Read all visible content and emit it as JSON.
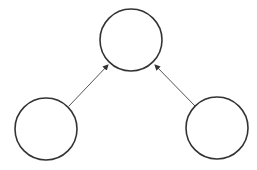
{
  "diagram": {
    "type": "directed-graph",
    "background": "#ffffff",
    "node_stroke": "#333333",
    "edge_stroke": "#555555",
    "nodes": [
      {
        "id": "top",
        "label": "",
        "cx": 131,
        "cy": 40,
        "r": 31
      },
      {
        "id": "bottom-left",
        "label": "",
        "cx": 46,
        "cy": 129,
        "r": 31
      },
      {
        "id": "bottom-right",
        "label": "",
        "cx": 217,
        "cy": 128,
        "r": 31
      }
    ],
    "edges": [
      {
        "from": "bottom-left",
        "to": "top",
        "x1": 69,
        "y1": 106,
        "x2": 108,
        "y2": 65
      },
      {
        "from": "bottom-right",
        "to": "top",
        "x1": 195,
        "y1": 106,
        "x2": 155,
        "y2": 65
      }
    ]
  }
}
